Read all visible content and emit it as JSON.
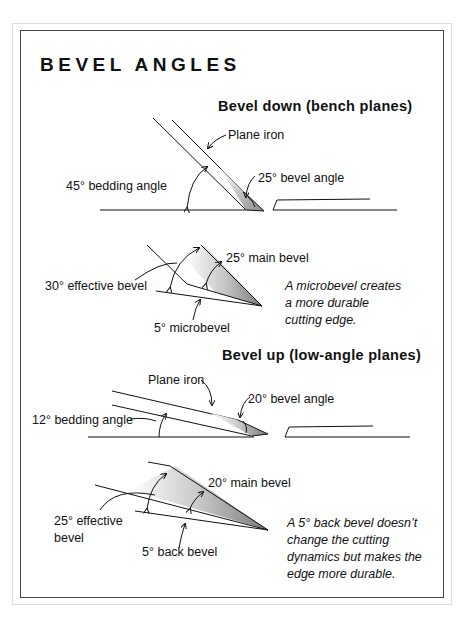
{
  "title": "BEVEL ANGLES",
  "sections": [
    {
      "heading": "Bevel down (bench planes)",
      "main_diagram": {
        "labels": {
          "plane_iron": "Plane iron",
          "bedding_angle": "45° bedding angle",
          "bevel_angle": "25° bevel angle"
        }
      },
      "detail_diagram": {
        "labels": {
          "effective_bevel": "30° effective bevel",
          "main_bevel": "25° main bevel",
          "microbevel": "5° microbevel"
        },
        "note": [
          "A microbevel creates",
          "a more durable",
          "cutting edge."
        ]
      }
    },
    {
      "heading": "Bevel up (low-angle planes)",
      "main_diagram": {
        "labels": {
          "plane_iron": "Plane iron",
          "bedding_angle": "12° bedding angle",
          "bevel_angle": "20° bevel angle"
        }
      },
      "detail_diagram": {
        "labels": {
          "effective_bevel_line1": "25° effective",
          "effective_bevel_line2": "bevel",
          "main_bevel": "20° main bevel",
          "back_bevel": "5° back bevel"
        },
        "note": [
          "A 5° back bevel doesn’t",
          "change the cutting",
          "dynamics but makes the",
          "edge more durable."
        ]
      }
    }
  ],
  "colors": {
    "ink": "#111111",
    "frame": "#444444",
    "bevel_shade": "#9a9a9a"
  }
}
